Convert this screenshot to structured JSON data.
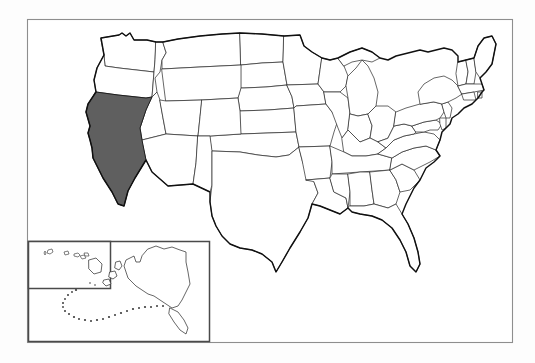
{
  "figure": {
    "title": "United States map with California highlighted",
    "type": "choropleth-outline-map",
    "region": "United States of America",
    "projection_note": "Alaska and Hawaii shown as lower-left insets",
    "label_text": "",
    "legend_text": "",
    "colors": {
      "page_background": "#fdfdfd",
      "map_background": "#ffffff",
      "frame_border": "#8e8e8e",
      "inset_border": "#4a4a4a",
      "state_fill": "#ffffff",
      "state_border": "#2b2b2b",
      "nation_outline": "#101010",
      "highlight_fill": "#5f5f5f",
      "highlight_border": "#1a1a1a"
    },
    "frame": {
      "x": 27,
      "y": 19,
      "width": 486,
      "height": 324
    },
    "insets": [
      {
        "name": "hawaii-inset-box",
        "label": "",
        "x": 28,
        "y": 241,
        "width": 82,
        "height": 47
      },
      {
        "name": "alaska-hawaii-inset-box",
        "label": "",
        "x": 28,
        "y": 241,
        "width": 182,
        "height": 101
      }
    ],
    "highlighted_states": [
      {
        "name": "California",
        "abbr": "CA",
        "fill": "#5f5f5f",
        "selected": true
      }
    ],
    "states": [
      {
        "name": "Washington",
        "abbr": "WA",
        "selected": false
      },
      {
        "name": "Oregon",
        "abbr": "OR",
        "selected": false
      },
      {
        "name": "California",
        "abbr": "CA",
        "selected": true
      },
      {
        "name": "Idaho",
        "abbr": "ID",
        "selected": false
      },
      {
        "name": "Nevada",
        "abbr": "NV",
        "selected": false
      },
      {
        "name": "Montana",
        "abbr": "MT",
        "selected": false
      },
      {
        "name": "Wyoming",
        "abbr": "WY",
        "selected": false
      },
      {
        "name": "Utah",
        "abbr": "UT",
        "selected": false
      },
      {
        "name": "Arizona",
        "abbr": "AZ",
        "selected": false
      },
      {
        "name": "Colorado",
        "abbr": "CO",
        "selected": false
      },
      {
        "name": "New Mexico",
        "abbr": "NM",
        "selected": false
      },
      {
        "name": "North Dakota",
        "abbr": "ND",
        "selected": false
      },
      {
        "name": "South Dakota",
        "abbr": "SD",
        "selected": false
      },
      {
        "name": "Nebraska",
        "abbr": "NE",
        "selected": false
      },
      {
        "name": "Kansas",
        "abbr": "KS",
        "selected": false
      },
      {
        "name": "Oklahoma",
        "abbr": "OK",
        "selected": false
      },
      {
        "name": "Texas",
        "abbr": "TX",
        "selected": false
      },
      {
        "name": "Minnesota",
        "abbr": "MN",
        "selected": false
      },
      {
        "name": "Iowa",
        "abbr": "IA",
        "selected": false
      },
      {
        "name": "Missouri",
        "abbr": "MO",
        "selected": false
      },
      {
        "name": "Arkansas",
        "abbr": "AR",
        "selected": false
      },
      {
        "name": "Louisiana",
        "abbr": "LA",
        "selected": false
      },
      {
        "name": "Wisconsin",
        "abbr": "WI",
        "selected": false
      },
      {
        "name": "Illinois",
        "abbr": "IL",
        "selected": false
      },
      {
        "name": "Michigan",
        "abbr": "MI",
        "selected": false
      },
      {
        "name": "Indiana",
        "abbr": "IN",
        "selected": false
      },
      {
        "name": "Ohio",
        "abbr": "OH",
        "selected": false
      },
      {
        "name": "Kentucky",
        "abbr": "KY",
        "selected": false
      },
      {
        "name": "Tennessee",
        "abbr": "TN",
        "selected": false
      },
      {
        "name": "Mississippi",
        "abbr": "MS",
        "selected": false
      },
      {
        "name": "Alabama",
        "abbr": "AL",
        "selected": false
      },
      {
        "name": "Georgia",
        "abbr": "GA",
        "selected": false
      },
      {
        "name": "Florida",
        "abbr": "FL",
        "selected": false
      },
      {
        "name": "South Carolina",
        "abbr": "SC",
        "selected": false
      },
      {
        "name": "North Carolina",
        "abbr": "NC",
        "selected": false
      },
      {
        "name": "Virginia",
        "abbr": "VA",
        "selected": false
      },
      {
        "name": "West Virginia",
        "abbr": "WV",
        "selected": false
      },
      {
        "name": "Maryland",
        "abbr": "MD",
        "selected": false
      },
      {
        "name": "Delaware",
        "abbr": "DE",
        "selected": false
      },
      {
        "name": "Pennsylvania",
        "abbr": "PA",
        "selected": false
      },
      {
        "name": "New Jersey",
        "abbr": "NJ",
        "selected": false
      },
      {
        "name": "New York",
        "abbr": "NY",
        "selected": false
      },
      {
        "name": "Connecticut",
        "abbr": "CT",
        "selected": false
      },
      {
        "name": "Rhode Island",
        "abbr": "RI",
        "selected": false
      },
      {
        "name": "Massachusetts",
        "abbr": "MA",
        "selected": false
      },
      {
        "name": "Vermont",
        "abbr": "VT",
        "selected": false
      },
      {
        "name": "New Hampshire",
        "abbr": "NH",
        "selected": false
      },
      {
        "name": "Maine",
        "abbr": "ME",
        "selected": false
      },
      {
        "name": "Alaska",
        "abbr": "AK",
        "selected": false
      },
      {
        "name": "Hawaii",
        "abbr": "HI",
        "selected": false
      }
    ]
  }
}
